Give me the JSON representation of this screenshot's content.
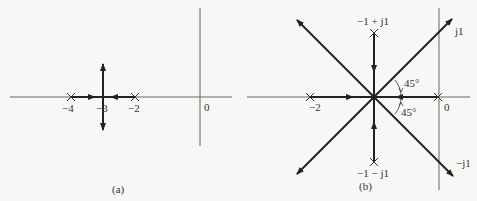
{
  "figure_a": {
    "caption": "(a)",
    "poles": [
      {
        "label": "−4",
        "x": 71
      },
      {
        "label": "−2",
        "x": 135
      }
    ],
    "breakaway_label": "−3",
    "origin_label": "0"
  },
  "figure_b": {
    "caption": "(b)",
    "poles": [
      {
        "label": "−2"
      },
      {
        "label": "0"
      },
      {
        "label": "−1 + j1"
      },
      {
        "label": "−1 − j1"
      }
    ],
    "asymptote_labels": {
      "upper": "j1",
      "lower": "−j1"
    },
    "angle_labels": {
      "upper": "45°",
      "lower": "45°"
    }
  },
  "colors": {
    "line": "#2a2a2a",
    "axis": "#666666",
    "background": "#f7f7f5"
  }
}
